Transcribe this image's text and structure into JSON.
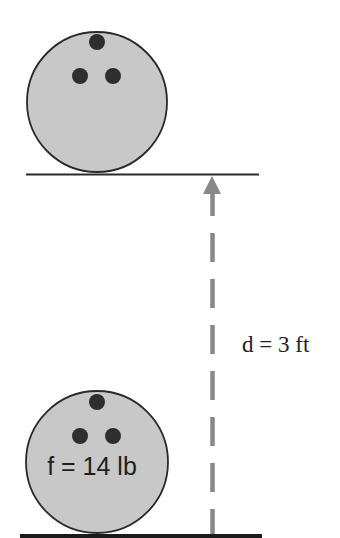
{
  "diagram": {
    "title": "",
    "top_ball": {
      "label": ""
    },
    "bottom_ball": {
      "label": "f = 14 lb"
    },
    "displacement": {
      "label": "d = 3 ft",
      "direction": "up"
    },
    "colors": {
      "ball_fill": "#c8c8c8",
      "ball_stroke": "#2a2a2a",
      "finger_hole": "#2e2e2e",
      "arrow": "#888888",
      "floor": "#1a1a1a",
      "text": "#222222"
    }
  }
}
